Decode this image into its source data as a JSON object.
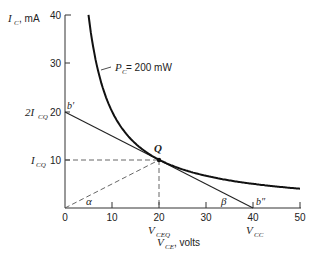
{
  "chart_data": {
    "type": "line",
    "title": "",
    "xlabel": "V_CE, volts",
    "ylabel": "I_C, mA",
    "xlim": [
      0,
      50
    ],
    "ylim": [
      0,
      40
    ],
    "x_ticks": [
      0,
      10,
      20,
      30,
      40,
      50
    ],
    "y_ticks": [
      10,
      20,
      30,
      40
    ],
    "grid": false,
    "series": [
      {
        "name": "P_C = 200 mW",
        "kind": "hyperbola",
        "formula": "I_C = 200 / V_CE",
        "x": [
          5,
          6,
          8,
          10,
          12.5,
          15,
          20,
          25,
          30,
          40,
          50
        ],
        "y": [
          40,
          33.3,
          25,
          20,
          16,
          13.3,
          10,
          8,
          6.67,
          5,
          4
        ]
      },
      {
        "name": "Load line b'-b''",
        "kind": "line",
        "x": [
          0,
          40
        ],
        "y": [
          20,
          0
        ]
      },
      {
        "name": "Origin to Q (dashed)",
        "kind": "dashed",
        "x": [
          0,
          20
        ],
        "y": [
          0,
          10
        ]
      }
    ],
    "points": [
      {
        "label": "Q",
        "x": 20,
        "y": 10
      },
      {
        "label": "b'",
        "x": 0,
        "y": 20
      },
      {
        "label": "b''",
        "x": 40,
        "y": 0
      }
    ],
    "annotations": {
      "curve_label": "P_C = 200 mW",
      "y_marks": [
        {
          "text": "2I_CQ",
          "value": 20
        },
        {
          "text": "I_CQ",
          "value": 10
        }
      ],
      "x_marks": [
        {
          "text": "V_CEQ",
          "value": 20
        },
        {
          "text": "V_CC",
          "value": 40
        }
      ],
      "angles": [
        "α",
        "β"
      ]
    }
  },
  "labels": {
    "y_axis_main": "I",
    "y_axis_sub": "C",
    "y_axis_unit": ", mA",
    "x_axis_main": "V",
    "x_axis_sub": "CE",
    "x_axis_unit": ", volts",
    "curve_p": "P",
    "curve_sub": "C",
    "curve_rest": " = 200 mW",
    "b_prime": "b′",
    "b_dprime": "b″",
    "q": "Q",
    "alpha": "α",
    "beta": "β",
    "two_icq_pre": "2I",
    "icq_main": "I",
    "cq_sub": "CQ",
    "vceq_main": "V",
    "vceq_sub": "CEQ",
    "vcc_main": "V",
    "vcc_sub": "CC",
    "ticks_x": [
      "0",
      "10",
      "20",
      "30",
      "40",
      "50"
    ],
    "ticks_y": [
      "10",
      "20",
      "30",
      "40"
    ]
  }
}
